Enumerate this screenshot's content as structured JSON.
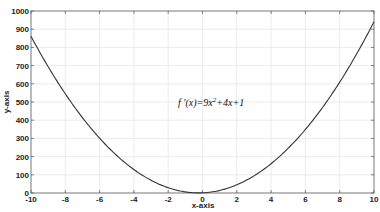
{
  "chart_data": {
    "type": "line",
    "title": "",
    "xlabel": "x-axis",
    "ylabel": "y-axis",
    "xlim": [
      -10,
      10
    ],
    "ylim": [
      0,
      1000
    ],
    "xticks": [
      -10,
      -8,
      -6,
      -4,
      -2,
      0,
      2,
      4,
      6,
      8,
      10
    ],
    "yticks": [
      0,
      100,
      200,
      300,
      400,
      500,
      600,
      700,
      800,
      900,
      1000
    ],
    "grid": true,
    "legend": null,
    "annotation": "f '(x)=9x^2+4x+1",
    "series": [
      {
        "name": "f'(x)=9x^2+4x+1",
        "color": "#333333",
        "x": [
          -10,
          -9,
          -8,
          -7,
          -6,
          -5,
          -4,
          -3,
          -2,
          -1,
          0,
          1,
          2,
          3,
          4,
          5,
          6,
          7,
          8,
          9,
          10
        ],
        "y": [
          861,
          694,
          545,
          414,
          301,
          206,
          129,
          70,
          29,
          6,
          1,
          14,
          45,
          94,
          161,
          246,
          349,
          470,
          609,
          766,
          941
        ]
      }
    ]
  },
  "annotation": {
    "prefix": "f '(x)=9x",
    "exp": "2",
    "suffix": "+4x+1"
  }
}
